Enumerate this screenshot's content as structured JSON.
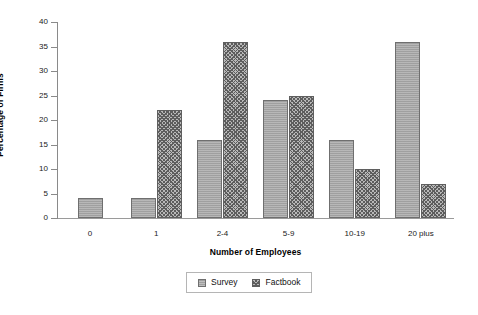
{
  "chart_data": {
    "type": "bar",
    "title": "",
    "xlabel": "Number of Employees",
    "ylabel": "Percentage of Firms",
    "categories": [
      "0",
      "1",
      "2-4",
      "5-9",
      "10-19",
      "20 plus"
    ],
    "series": [
      {
        "name": "Survey",
        "values": [
          4,
          4,
          16,
          24,
          16,
          36
        ]
      },
      {
        "name": "Factbook",
        "values": [
          null,
          22,
          36,
          25,
          10,
          7
        ]
      }
    ],
    "ylim": [
      0,
      40
    ],
    "yticks": [
      0,
      5,
      10,
      15,
      20,
      25,
      30,
      35,
      40
    ],
    "ytick_labels": [
      "0",
      "5",
      "10",
      "15",
      "20",
      "25",
      "30",
      "35",
      "40"
    ],
    "grid": false,
    "legend_position": "bottom-center",
    "colors": {
      "survey_fill": "#a8a8a8",
      "factbook_fill": "#b9b9b9",
      "factbook_hatch": "#5d5d5d",
      "bar_border": "#6f6f6f",
      "axis": "#8a8a8a",
      "text": "#111111",
      "background": "#ffffff"
    }
  },
  "legend": {
    "entries": [
      {
        "label": "Survey"
      },
      {
        "label": "Factbook"
      }
    ]
  }
}
